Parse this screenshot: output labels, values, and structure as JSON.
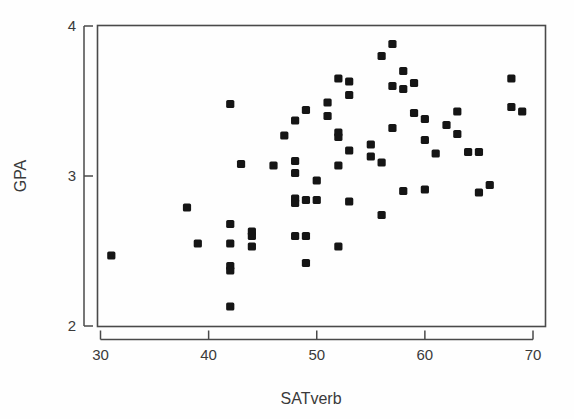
{
  "chart_data": {
    "type": "scatter",
    "title": "",
    "xlabel": "SATverb",
    "ylabel": "GPA",
    "xlim": [
      29,
      71
    ],
    "ylim": [
      2,
      4
    ],
    "xticks": [
      30,
      40,
      50,
      60,
      70
    ],
    "xtick_labels": [
      "30",
      "40",
      "50",
      "60",
      "70"
    ],
    "yticks": [
      2,
      3,
      4
    ],
    "ytick_labels": [
      "2",
      "3",
      "4"
    ],
    "grid": false,
    "legend": null,
    "marker": "filled-square",
    "marker_color": "#151515",
    "frame_color": "#4a4a4a",
    "points": [
      [
        31,
        2.47
      ],
      [
        38,
        2.79
      ],
      [
        39,
        2.55
      ],
      [
        42,
        3.48
      ],
      [
        42,
        2.68
      ],
      [
        42,
        2.55
      ],
      [
        42,
        2.4
      ],
      [
        42,
        2.37
      ],
      [
        42,
        2.13
      ],
      [
        43,
        3.08
      ],
      [
        44,
        2.63
      ],
      [
        44,
        2.6
      ],
      [
        44,
        2.53
      ],
      [
        46,
        3.07
      ],
      [
        47,
        3.27
      ],
      [
        48,
        3.37
      ],
      [
        48,
        3.1
      ],
      [
        48,
        3.02
      ],
      [
        48,
        2.85
      ],
      [
        48,
        2.82
      ],
      [
        48,
        2.6
      ],
      [
        49,
        3.44
      ],
      [
        49,
        2.84
      ],
      [
        49,
        2.6
      ],
      [
        49,
        2.42
      ],
      [
        50,
        2.97
      ],
      [
        50,
        2.84
      ],
      [
        51,
        3.49
      ],
      [
        51,
        3.4
      ],
      [
        52,
        3.65
      ],
      [
        52,
        3.29
      ],
      [
        52,
        3.26
      ],
      [
        52,
        3.07
      ],
      [
        52,
        2.53
      ],
      [
        53,
        3.63
      ],
      [
        53,
        3.54
      ],
      [
        53,
        3.17
      ],
      [
        53,
        2.83
      ],
      [
        55,
        3.21
      ],
      [
        55,
        3.13
      ],
      [
        56,
        3.8
      ],
      [
        56,
        3.09
      ],
      [
        56,
        2.74
      ],
      [
        57,
        3.88
      ],
      [
        57,
        3.6
      ],
      [
        57,
        3.32
      ],
      [
        58,
        3.7
      ],
      [
        58,
        3.58
      ],
      [
        58,
        2.9
      ],
      [
        59,
        3.42
      ],
      [
        59,
        3.62
      ],
      [
        60,
        3.38
      ],
      [
        60,
        3.24
      ],
      [
        60,
        2.91
      ],
      [
        61,
        3.15
      ],
      [
        62,
        3.34
      ],
      [
        63,
        3.43
      ],
      [
        63,
        3.28
      ],
      [
        64,
        3.16
      ],
      [
        65,
        3.16
      ],
      [
        65,
        2.89
      ],
      [
        66,
        2.94
      ],
      [
        68,
        3.65
      ],
      [
        68,
        3.46
      ],
      [
        69,
        3.43
      ]
    ]
  },
  "axes": {
    "x_title": "SATverb",
    "y_title": "GPA"
  }
}
